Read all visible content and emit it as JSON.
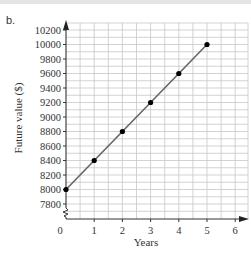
{
  "part_label": "b.",
  "chart_data": {
    "type": "line",
    "title": "",
    "xlabel": "Years",
    "ylabel": "Future value ($)",
    "x": [
      0,
      1,
      2,
      3,
      4,
      5
    ],
    "series": [
      {
        "name": "Future value",
        "values": [
          8000,
          8400,
          8800,
          9200,
          9600,
          10000
        ]
      }
    ],
    "x_ticks": [
      "0",
      "1",
      "2",
      "3",
      "4",
      "5",
      "6"
    ],
    "y_ticks": [
      "7800",
      "8000",
      "8200",
      "8400",
      "8600",
      "8800",
      "9000",
      "9200",
      "9400",
      "9600",
      "9800",
      "10000",
      "10200"
    ],
    "xlim": [
      0,
      6.5
    ],
    "ylim": [
      7800,
      10200
    ],
    "y_axis_break": true,
    "grid": true,
    "markers": "filled-circle",
    "line_color": "#666666",
    "marker_color": "#000000",
    "grid_color": "#c8c8c8"
  }
}
